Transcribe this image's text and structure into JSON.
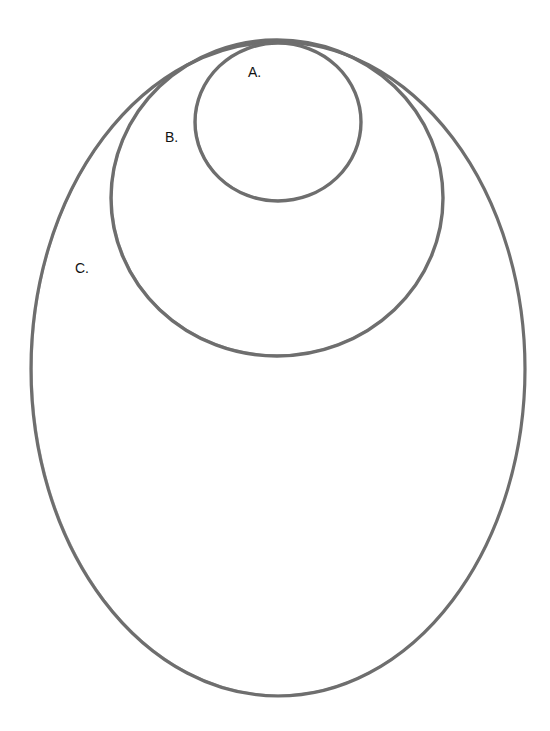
{
  "diagram": {
    "type": "nested-ellipses",
    "stroke_color": "#6e6e6e",
    "background": "#ffffff",
    "shapes": [
      {
        "id": "A",
        "label": "A.",
        "nesting_level": 1,
        "contained_in": [
          "B",
          "C"
        ]
      },
      {
        "id": "B",
        "label": "B.",
        "nesting_level": 2,
        "contains": [
          "A"
        ],
        "contained_in": [
          "C"
        ]
      },
      {
        "id": "C",
        "label": "C.",
        "nesting_level": 3,
        "contains": [
          "A",
          "B"
        ]
      }
    ]
  }
}
